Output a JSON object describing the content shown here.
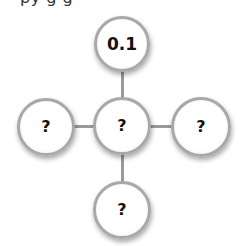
{
  "header": {
    "cropped_text": "py g   g"
  },
  "diagram": {
    "type": "cross-shaped node diagram",
    "nodes": [
      {
        "id": "top",
        "label": "0.1",
        "cx": 122,
        "cy": 44,
        "r": 28
      },
      {
        "id": "center",
        "label": "?",
        "cx": 122,
        "cy": 126,
        "r": 29
      },
      {
        "id": "left",
        "label": "?",
        "cx": 46,
        "cy": 127,
        "r": 29
      },
      {
        "id": "right",
        "label": "?",
        "cx": 201,
        "cy": 127,
        "r": 30
      },
      {
        "id": "bottom",
        "label": "?",
        "cx": 122,
        "cy": 210,
        "r": 29
      }
    ],
    "edges": [
      {
        "from": "top",
        "to": "center"
      },
      {
        "from": "left",
        "to": "center"
      },
      {
        "from": "center",
        "to": "right"
      },
      {
        "from": "center",
        "to": "bottom"
      }
    ],
    "colors": {
      "node_border": "#a8a8a8",
      "node_fill": "#ffffff",
      "connector": "#9a9a9a",
      "text": "#111111"
    }
  }
}
